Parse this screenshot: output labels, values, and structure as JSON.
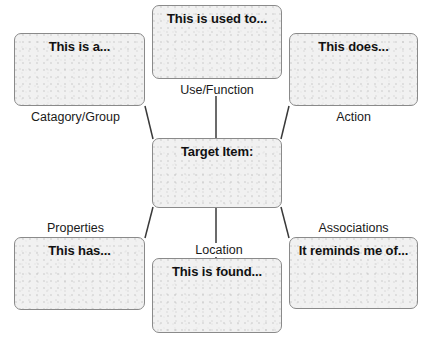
{
  "diagram": {
    "style": {
      "box_fill": "#f1f1f1",
      "box_border": "#8a8a8a",
      "connector": "#3a3a3a",
      "text": "#111111",
      "background": "#ffffff"
    },
    "center": {
      "id": "target-item",
      "text": "Target Item:",
      "caption": ""
    },
    "nodes": [
      {
        "id": "use-function",
        "text": "This is used to...",
        "caption": "Use/Function",
        "caption_position": "below"
      },
      {
        "id": "category-group",
        "text": "This is a...",
        "caption": "Catagory/Group",
        "caption_position": "below"
      },
      {
        "id": "action",
        "text": "This does...",
        "caption": "Action",
        "caption_position": "below"
      },
      {
        "id": "properties",
        "text": "This has...",
        "caption": "Properties",
        "caption_position": "above"
      },
      {
        "id": "location",
        "text": "This is found...",
        "caption": "Location",
        "caption_position": "above"
      },
      {
        "id": "associations",
        "text": "It reminds me of...",
        "caption": "Associations",
        "caption_position": "above"
      }
    ]
  }
}
